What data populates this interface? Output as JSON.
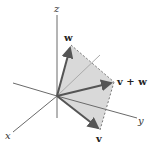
{
  "diagram": {
    "title": "",
    "axes": {
      "x_label": "x",
      "y_label": "y",
      "z_label": "z"
    },
    "vectors": {
      "w_label": "w",
      "v_label": "v",
      "sum_label": "v + w"
    },
    "colors": {
      "parallelogram_fill": "#d9d9d9",
      "axis": "#6a6a6a",
      "vector": "#555555"
    }
  }
}
